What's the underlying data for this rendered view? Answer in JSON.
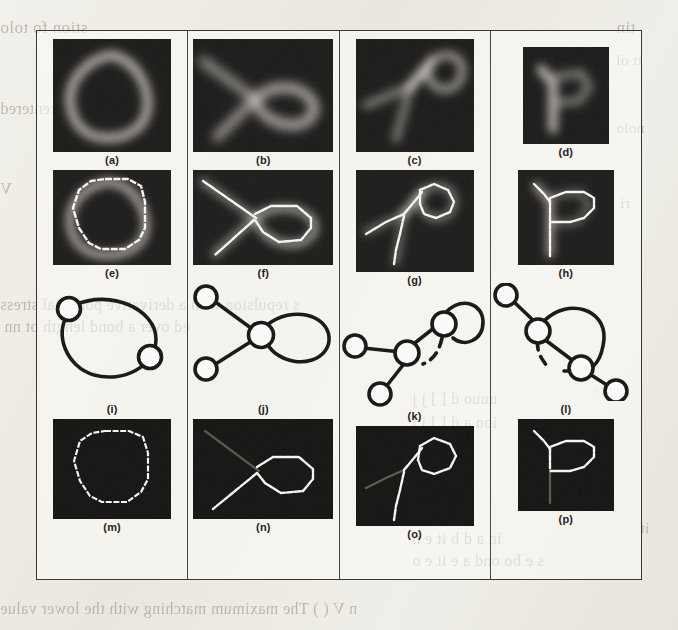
{
  "figure": {
    "colors": {
      "page_background": "#eceae4",
      "frame_border": "#3a3631",
      "panel_background": "#111010",
      "contour_stroke": "#f4f2ee",
      "graph_stroke": "#1d1b19"
    },
    "columns": [
      {
        "id": "col-1",
        "cells": [
          {
            "caption": "(a)",
            "kind": "grayscale-image",
            "content": "blurred triangular loop",
            "w": 118,
            "h": 113
          },
          {
            "caption": "(e)",
            "kind": "grayscale-image-with-contour",
            "content": "triangular loop contour overlaid on blurred image",
            "w": 118,
            "h": 95
          },
          {
            "caption": "(i)",
            "kind": "graph-diagram",
            "content": "oval loop with two nodes",
            "w": 148,
            "h": 118
          },
          {
            "caption": "(m)",
            "kind": "contour-on-black",
            "content": "triangular loop contour",
            "w": 118,
            "h": 100
          }
        ]
      },
      {
        "id": "col-2",
        "cells": [
          {
            "caption": "(b)",
            "kind": "grayscale-image",
            "content": "blurred crossing strokes with loop",
            "w": 140,
            "h": 113
          },
          {
            "caption": "(f)",
            "kind": "grayscale-image-with-contour",
            "content": "diagonal line crossing a closed loop",
            "w": 140,
            "h": 95
          },
          {
            "caption": "(j)",
            "kind": "graph-diagram",
            "content": "central node, two leaf nodes, one self-loop",
            "w": 148,
            "h": 118
          },
          {
            "caption": "(n)",
            "kind": "contour-on-black",
            "content": "diagonal line crossing a closed loop",
            "w": 140,
            "h": 100
          }
        ]
      },
      {
        "id": "col-3",
        "cells": [
          {
            "caption": "(c)",
            "kind": "grayscale-image",
            "content": "blurred branching strokes with loop",
            "w": 118,
            "h": 113
          },
          {
            "caption": "(g)",
            "kind": "grayscale-image-with-contour",
            "content": "branching strokes with small loop",
            "w": 118,
            "h": 102
          },
          {
            "caption": "(k)",
            "kind": "graph-diagram",
            "content": "node with self-loop, junction node, two leaves, one dashed edge",
            "w": 148,
            "h": 118
          },
          {
            "caption": "(o)",
            "kind": "contour-on-black",
            "content": "branching strokes with small loop",
            "w": 118,
            "h": 100
          }
        ]
      },
      {
        "id": "col-4",
        "cells": [
          {
            "caption": "(d)",
            "kind": "grayscale-image",
            "content": "blurred letter P shape",
            "w": 86,
            "h": 97
          },
          {
            "caption": "(h)",
            "kind": "grayscale-image-with-contour",
            "content": "letter P contour overlaid on blurred image",
            "w": 96,
            "h": 95
          },
          {
            "caption": "(l)",
            "kind": "graph-diagram",
            "content": "chain of nodes with large loop and one dashed edge",
            "w": 148,
            "h": 118
          },
          {
            "caption": "(p)",
            "kind": "contour-on-black",
            "content": "letter P contour",
            "w": 96,
            "h": 92
          }
        ]
      }
    ]
  },
  "bleed_through_text": [
    {
      "text": "tin",
      "x": 616,
      "y": 18,
      "size": 17
    },
    {
      "text": "stion fo tolo",
      "x": 0,
      "y": 18,
      "size": 17
    },
    {
      "text": "ti ol",
      "x": 616,
      "y": 52,
      "size": 15
    },
    {
      "text": "centered",
      "x": 0,
      "y": 100,
      "size": 16
    },
    {
      "text": "nolo",
      "x": 616,
      "y": 120,
      "size": 15
    },
    {
      "text": "V",
      "x": 0,
      "y": 180,
      "size": 16
    },
    {
      "text": "ri",
      "x": 620,
      "y": 195,
      "size": 15
    },
    {
      "text": "s repulsion with a derivative potential stress",
      "x": 0,
      "y": 296,
      "size": 16
    },
    {
      "text": "ed over a bond length  ot   nn",
      "x": 4,
      "y": 318,
      "size": 16
    },
    {
      "text": "uuuo   d  [ ]  j j",
      "x": 412,
      "y": 390,
      "size": 16
    },
    {
      "text": "ion  a d  [ ]   j  j",
      "x": 412,
      "y": 414,
      "size": 16
    },
    {
      "text": "it",
      "x": 640,
      "y": 520,
      "size": 15
    },
    {
      "text": "in  a d   b   it e   n",
      "x": 412,
      "y": 530,
      "size": 16
    },
    {
      "text": "s   e bo ond  a e it   e o",
      "x": 412,
      "y": 552,
      "size": 16
    },
    {
      "text": "n  V (  ) The maximum matching  with the lower value",
      "x": 0,
      "y": 600,
      "size": 16
    }
  ]
}
